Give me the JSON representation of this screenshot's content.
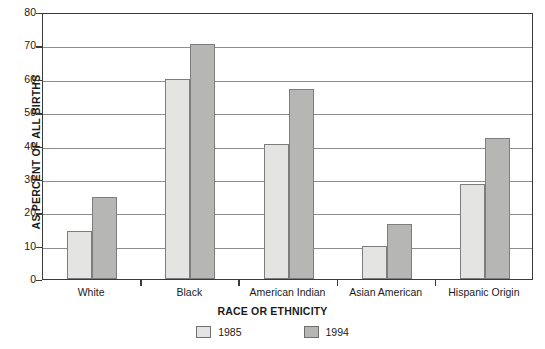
{
  "chart_data": {
    "type": "bar",
    "title": "",
    "xlabel": "RACE OR ETHNICITY",
    "ylabel": "AS PERCENT OF ALL BIRTHS",
    "categories": [
      "White",
      "Black",
      "American Indian",
      "Asian American",
      "Hispanic Origin"
    ],
    "series": [
      {
        "name": "1985",
        "values": [
          14.5,
          59.8,
          40.4,
          9.8,
          28.5
        ],
        "color": "#e4e4e2"
      },
      {
        "name": "1994",
        "values": [
          24.5,
          70.4,
          57.0,
          16.4,
          42.2
        ],
        "color": "#b6b6b4"
      }
    ],
    "ylim": [
      0,
      80
    ],
    "yticks": [
      0,
      10,
      20,
      30,
      40,
      50,
      60,
      70,
      80
    ],
    "ytick_labels": [
      "0",
      "10",
      "20",
      "30",
      "40",
      "50",
      "60",
      "70",
      "80"
    ],
    "grid": true,
    "legend_position": "bottom",
    "legend_entries": [
      "1985",
      "1994"
    ]
  }
}
